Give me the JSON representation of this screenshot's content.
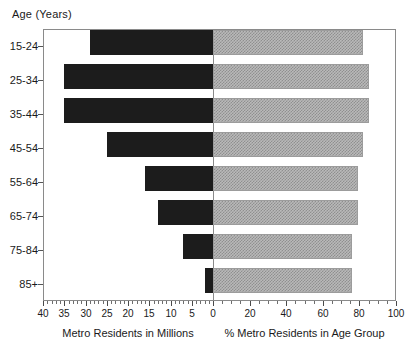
{
  "chart_data": {
    "type": "bar",
    "orientation": "horizontal",
    "title": "",
    "categories": [
      "15-24",
      "25-34",
      "35-44",
      "45-54",
      "55-64",
      "65-74",
      "75-84",
      "85+"
    ],
    "ylabel": "Age (Years)",
    "panels": [
      {
        "name": "metro-residents-millions",
        "xlabel": "Metro Residents in Millions",
        "direction": "left",
        "xlim": [
          40,
          0
        ],
        "xticks": [
          40,
          35,
          30,
          25,
          20,
          15,
          10,
          5,
          0
        ],
        "ticklabels": [
          "40",
          "35",
          "30",
          "25",
          "20",
          "15",
          "10",
          "5",
          "0"
        ],
        "minor_tick_step": 1,
        "values": [
          29,
          35,
          35,
          25,
          16,
          13,
          7,
          2
        ],
        "fill": "#1c1c1c"
      },
      {
        "name": "percent-metro-residents-in-age-group",
        "xlabel": "% Metro Residents in Age Group",
        "direction": "right",
        "xlim": [
          0,
          100
        ],
        "xticks": [
          0,
          20,
          40,
          60,
          80,
          100
        ],
        "ticklabels": [
          "0",
          "20",
          "40",
          "60",
          "80",
          "100"
        ],
        "minor_tick_step": 5,
        "values": [
          82,
          85,
          85,
          82,
          79,
          79,
          76,
          76
        ],
        "fill": "#b9b9b9"
      }
    ],
    "grid": false,
    "legend": "none",
    "frame": true
  },
  "axis_titles": {
    "y": "Age (Years)",
    "x_left": "Metro Residents in Millions",
    "x_right": "% Metro Residents in Age Group"
  }
}
